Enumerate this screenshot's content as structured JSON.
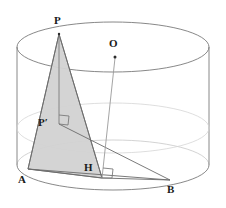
{
  "figure": {
    "type": "solid-geometry-diagram",
    "solid": "cylinder",
    "width": 226,
    "height": 208,
    "background_color": "#ffffff",
    "stroke_color": "#6b6b6b",
    "faint_stroke_color": "#b9b9b9",
    "shade_fill": "#d2d2d2",
    "label_color": "#1a1a1a"
  },
  "labels": {
    "apex": "P",
    "center": "O",
    "projection": "P′",
    "foot": "H",
    "base_left": "A",
    "base_right": "B"
  },
  "points": {
    "P": {
      "x": 59,
      "y": 34,
      "label_x": 54,
      "label_y": 18
    },
    "O": {
      "x": 115,
      "y": 57,
      "label_x": 110,
      "label_y": 40
    },
    "Pp": {
      "x": 59,
      "y": 124,
      "label_x": 40,
      "label_y": 119
    },
    "H": {
      "x": 102,
      "y": 178,
      "label_x": 84,
      "label_y": 164
    },
    "A": {
      "x": 28,
      "y": 169,
      "label_x": 20,
      "label_y": 177
    },
    "B": {
      "x": 170,
      "y": 180,
      "label_x": 168,
      "label_y": 186
    }
  },
  "cylinder": {
    "center_x": 113,
    "rx": 96,
    "ry": 25,
    "top_y": 47,
    "bottom_y": 165,
    "mid_y": 128
  },
  "right_angle_marks": [
    {
      "name": "right-angle-at-p-prime",
      "x": 59,
      "y": 124
    },
    {
      "name": "right-angle-at-h",
      "x": 102,
      "y": 178
    }
  ],
  "segments": [
    {
      "name": "segment-P-A",
      "from": "P",
      "to": "A"
    },
    {
      "name": "segment-P-H",
      "from": "P",
      "to": "H"
    },
    {
      "name": "segment-P-Pprime",
      "from": "P",
      "to": "Pp"
    },
    {
      "name": "segment-A-H",
      "from": "A",
      "to": "H"
    },
    {
      "name": "segment-A-B",
      "from": "A",
      "to": "B"
    },
    {
      "name": "segment-Pprime-B",
      "from": "Pp",
      "to": "B"
    },
    {
      "name": "segment-O-base",
      "from": "O",
      "to": "H"
    },
    {
      "name": "segment-H-B",
      "from": "H",
      "to": "B"
    }
  ],
  "shaded_region": {
    "name": "triangle-P-A-H",
    "vertices": [
      "P",
      "A",
      "H"
    ],
    "fill": "#d2d2d2"
  }
}
